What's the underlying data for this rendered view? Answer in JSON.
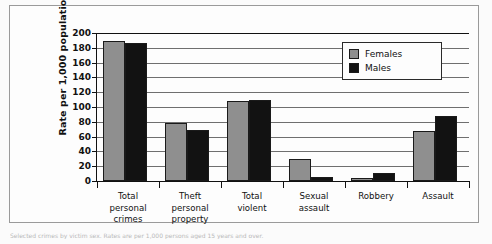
{
  "figure": {
    "ylabel": "Rate per 1,000 population",
    "caption_fragment": "Selected crimes by victim sex. Rates are per 1,000 persons aged 15 years and over."
  },
  "legend": {
    "items": [
      {
        "label": "Females",
        "swatch": "legend-swatch-females",
        "color": "#8f8f8f"
      },
      {
        "label": "Males",
        "swatch": "legend-swatch-males",
        "color": "#121212"
      }
    ]
  },
  "yaxis": {
    "ticks": [
      "0",
      "20",
      "40",
      "60",
      "80",
      "100",
      "120",
      "140",
      "160",
      "180",
      "200"
    ]
  },
  "chart_data": {
    "type": "bar",
    "title": "",
    "xlabel": "",
    "ylabel": "Rate per 1,000 population",
    "ylim": [
      0,
      200
    ],
    "ytick_step": 20,
    "grid": true,
    "legend_position": "top-right",
    "categories": [
      "Total personal crimes",
      "Theft personal property",
      "Total violent",
      "Sexual assault",
      "Robbery",
      "Assault"
    ],
    "category_lines": [
      [
        "Total",
        "personal",
        "crimes"
      ],
      [
        "Theft",
        "personal",
        "property"
      ],
      [
        "Total",
        "violent"
      ],
      [
        "Sexual",
        "assault"
      ],
      [
        "Robbery"
      ],
      [
        "Assault"
      ]
    ],
    "series": [
      {
        "name": "Females",
        "color": "#8f8f8f",
        "values": [
          189,
          78,
          108,
          30,
          4,
          67
        ]
      },
      {
        "name": "Males",
        "color": "#121212",
        "values": [
          186,
          69,
          110,
          6,
          11,
          88
        ]
      }
    ]
  }
}
